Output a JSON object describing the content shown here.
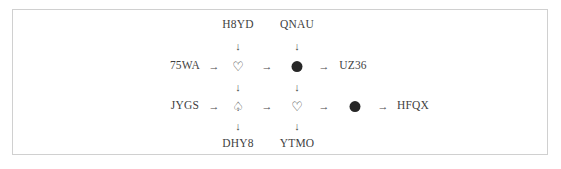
{
  "diagram": {
    "title": "",
    "frame": {
      "border_color": "#d0d0d0",
      "background": "#ffffff"
    },
    "text_color": "#3a3a3a",
    "node_fill_color": "#272727",
    "arrow_right": "→",
    "arrow_down": "↓",
    "symbols": {
      "heart_outline": "♡",
      "spade_outline": "♤",
      "filled_circle": "●"
    },
    "top_labels": [
      {
        "id": "top-1",
        "text": "H8YD"
      },
      {
        "id": "top-2",
        "text": "QNAU"
      }
    ],
    "bottom_labels": [
      {
        "id": "bottom-1",
        "text": "DHY8"
      },
      {
        "id": "bottom-2",
        "text": "YTMO"
      }
    ],
    "rows": [
      {
        "id": "row-1",
        "input_label": "75WA",
        "output_label": "UZ36",
        "nodes": [
          {
            "id": "node-r1-c1",
            "kind": "heart-outline",
            "glyph": "♡"
          },
          {
            "id": "node-r1-c2",
            "kind": "filled-circle",
            "glyph": "●"
          }
        ]
      },
      {
        "id": "row-2",
        "input_label": "JYGS",
        "output_label": "HFQX",
        "nodes": [
          {
            "id": "node-r2-c1",
            "kind": "spade-outline",
            "glyph": "♤"
          },
          {
            "id": "node-r2-c2",
            "kind": "heart-outline",
            "glyph": "♡"
          },
          {
            "id": "node-r2-c3",
            "kind": "filled-circle",
            "glyph": "●"
          }
        ]
      }
    ]
  }
}
